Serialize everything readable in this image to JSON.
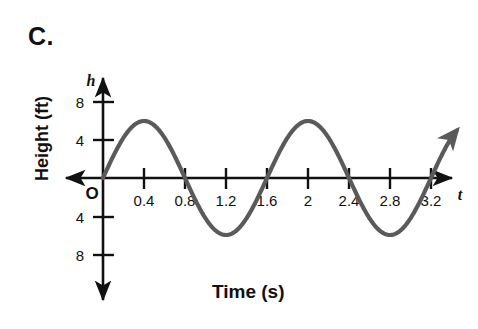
{
  "figure": {
    "item_label": "C.",
    "x_axis_title": "Time (s)",
    "y_axis_title": "Height (ft)",
    "origin_label": "O",
    "x_axis_variable": "t",
    "y_axis_variable": "h",
    "curve_color": "#5a5a5a",
    "axis_color": "#111111"
  },
  "chart_data": {
    "type": "line",
    "title": "",
    "xlabel": "Time (s)",
    "ylabel": "Height (ft)",
    "x_variable": "t",
    "y_variable": "h",
    "xlim": [
      -0.18,
      3.55
    ],
    "ylim": [
      -9.5,
      9.5
    ],
    "grid": false,
    "legend": null,
    "x_ticks": [
      0.4,
      0.8,
      1.2,
      1.6,
      2,
      2.4,
      2.8,
      3.2
    ],
    "x_tick_labels": [
      "0.4",
      "0.8",
      "1.2",
      "1.6",
      "2",
      "2.4",
      "2.8",
      "3.2"
    ],
    "y_ticks": [
      8,
      4,
      -4,
      -8
    ],
    "y_tick_labels": [
      "8",
      "4",
      "4",
      "8"
    ],
    "series": [
      {
        "name": "height",
        "equation": "h = 6 sin(2*pi*t/1.6)",
        "amplitude": 6,
        "period": 1.6,
        "phase": 0,
        "midline": 0,
        "x_start": 0,
        "x_end": 3.45,
        "arrow_end": true,
        "points": [
          {
            "t": 0,
            "h": 0
          },
          {
            "t": 0.4,
            "h": 6
          },
          {
            "t": 0.8,
            "h": 0
          },
          {
            "t": 1.2,
            "h": -6
          },
          {
            "t": 1.6,
            "h": 0
          },
          {
            "t": 2.0,
            "h": 6
          },
          {
            "t": 2.4,
            "h": 0
          },
          {
            "t": 2.8,
            "h": -6
          },
          {
            "t": 3.2,
            "h": 0
          },
          {
            "t": 3.45,
            "h": 5.2
          }
        ]
      }
    ]
  }
}
